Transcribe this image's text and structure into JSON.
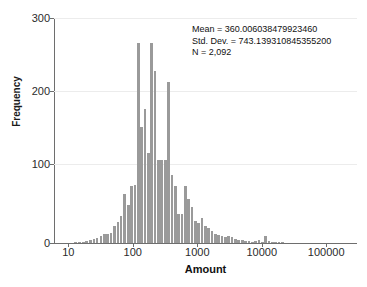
{
  "chart_data": {
    "type": "bar",
    "subtype": "histogram",
    "title": "",
    "xlabel": "Amount",
    "ylabel": "Frequency",
    "xscale": "log",
    "xlim": [
      6,
      300000
    ],
    "ylim": [
      0,
      310
    ],
    "yticks": [
      0,
      100,
      200,
      300
    ],
    "ytick_labels": [
      "0",
      "100",
      "200",
      "300"
    ],
    "xticks": [
      10,
      100,
      1000,
      10000,
      100000
    ],
    "xtick_labels": [
      "10",
      "100",
      "1000",
      "10000",
      "100000"
    ],
    "grid": "horizontal",
    "bar_color": "#9a9a9a",
    "axis_color": "#6e6e6e",
    "grid_color": "#ececec",
    "legend": "none",
    "bin_centers": [
      13,
      15,
      17,
      19,
      22,
      25,
      28,
      32,
      36,
      41,
      46,
      52,
      59,
      66,
      75,
      85,
      96,
      108,
      122,
      138,
      155,
      175,
      197,
      222,
      250,
      282,
      318,
      358,
      404,
      455,
      513,
      578,
      651,
      734,
      827,
      932,
      1051,
      1184,
      1334,
      1504,
      1695,
      1910,
      2153,
      2426,
      2734,
      3081,
      3472,
      3913,
      4410,
      4970,
      5601,
      6312,
      7113,
      8016,
      9034,
      10180,
      11472,
      12928,
      14569,
      16417,
      18500,
      20849
    ],
    "values": [
      1,
      1,
      2,
      3,
      4,
      5,
      7,
      9,
      12,
      13,
      14,
      24,
      29,
      37,
      68,
      53,
      78,
      80,
      275,
      160,
      185,
      124,
      275,
      237,
      115,
      115,
      115,
      222,
      94,
      78,
      40,
      40,
      79,
      61,
      50,
      30,
      28,
      34,
      24,
      20,
      17,
      13,
      11,
      10,
      8,
      9,
      8,
      5,
      4,
      4,
      3,
      3,
      2,
      3,
      4,
      2,
      9,
      3,
      1,
      2,
      1,
      1
    ],
    "annotations": {
      "mean_label": "Mean = 360.006038479923460",
      "std_dev_label": "Std. Dev. = 743.139310845355200",
      "n_label": "N = 2,092",
      "mean_value": 360.00603847992346,
      "std_dev_value": 743.1393108453552,
      "n_value": 2092
    }
  }
}
